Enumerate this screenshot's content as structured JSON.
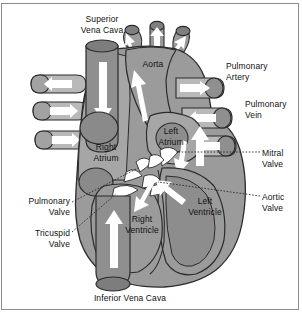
{
  "figure": {
    "kind": "anatomical-diagram",
    "palette": {
      "background": "#ffffff",
      "frame_border": "#8d8d8d",
      "muscle_mid": "#9b9b9b",
      "muscle_dark": "#7e7e7e",
      "muscle_light": "#c3c3c3",
      "chamber_dark": "#8a8a8a",
      "vessel_light": "#bdbdbd",
      "outline": "#2b2b2b",
      "arrow_fill": "#ffffff",
      "valve_fill": "#ffffff",
      "text": "#111111",
      "leader_line": "#2b2b2b"
    }
  },
  "labels": {
    "superior_vena_cava": {
      "text": "Superior\nVena Cava",
      "x": 68,
      "y": 14,
      "align": "center",
      "width": 68
    },
    "aorta": {
      "text": "Aorta",
      "x": 136,
      "y": 59,
      "align": "center",
      "width": 34
    },
    "pulmonary_artery": {
      "text": "Pulmonary\nArtery",
      "x": 226,
      "y": 61,
      "align": "left",
      "width": 62
    },
    "pulmonary_vein": {
      "text": "Pulmonary\nVein",
      "x": 245,
      "y": 99,
      "align": "left",
      "width": 62
    },
    "mitral_valve": {
      "text": "Mitral\nValve",
      "x": 262,
      "y": 148,
      "align": "left",
      "width": 40
    },
    "aortic_valve": {
      "text": "Aortic\nValve",
      "x": 262,
      "y": 192,
      "align": "left",
      "width": 40
    },
    "right_atrium": {
      "text": "Right\nAtrium",
      "x": 86,
      "y": 142,
      "align": "center",
      "width": 40
    },
    "left_atrium": {
      "text": "Left\nAtrium",
      "x": 152,
      "y": 126,
      "align": "center",
      "width": 38
    },
    "right_ventricle": {
      "text": "Right\nVentricle",
      "x": 116,
      "y": 214,
      "align": "center",
      "width": 52
    },
    "left_ventricle": {
      "text": "Left\nVentricle",
      "x": 180,
      "y": 196,
      "align": "center",
      "width": 50
    },
    "pulmonary_valve": {
      "text": "Pulmonary\nValve",
      "x": 8,
      "y": 196,
      "align": "right",
      "width": 62
    },
    "tricuspid_valve": {
      "text": "Tricuspid\nValve",
      "x": 8,
      "y": 228,
      "align": "right",
      "width": 62
    },
    "inferior_vena_cava": {
      "text": "Inferior Vena Cava",
      "x": 75,
      "y": 293,
      "align": "center",
      "width": 110
    }
  },
  "structures": {
    "vessels": [
      {
        "name": "superior-vena-cava",
        "label": "Superior Vena Cava"
      },
      {
        "name": "aorta",
        "label": "Aorta"
      },
      {
        "name": "aortic-arch-branch-left",
        "label": "Brachiocephalic branch"
      },
      {
        "name": "aortic-arch-branch-mid",
        "label": "Left common carotid branch"
      },
      {
        "name": "aortic-arch-branch-right",
        "label": "Left subclavian branch"
      },
      {
        "name": "pulmonary-artery",
        "label": "Pulmonary Artery"
      },
      {
        "name": "pulmonary-vein-upper",
        "label": "Pulmonary Vein"
      },
      {
        "name": "pulmonary-vein-lower",
        "label": "Pulmonary Vein"
      },
      {
        "name": "vena-cava-branch-upper",
        "label": "Vena cava tributary"
      },
      {
        "name": "vena-cava-branch-mid",
        "label": "Vena cava tributary"
      },
      {
        "name": "vena-cava-branch-lower",
        "label": "Vena cava tributary"
      },
      {
        "name": "inferior-vena-cava",
        "label": "Inferior Vena Cava"
      }
    ],
    "chambers": [
      {
        "name": "right-atrium",
        "label": "Right Atrium"
      },
      {
        "name": "left-atrium",
        "label": "Left Atrium"
      },
      {
        "name": "right-ventricle",
        "label": "Right Ventricle"
      },
      {
        "name": "left-ventricle",
        "label": "Left Ventricle"
      }
    ],
    "valves": [
      {
        "name": "pulmonary-valve",
        "label": "Pulmonary Valve"
      },
      {
        "name": "tricuspid-valve",
        "label": "Tricuspid Valve"
      },
      {
        "name": "mitral-valve",
        "label": "Mitral Valve"
      },
      {
        "name": "aortic-valve",
        "label": "Aortic Valve"
      }
    ],
    "flow_arrows_count": 12
  }
}
